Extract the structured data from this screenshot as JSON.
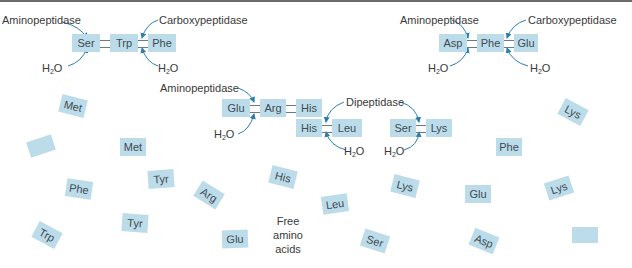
{
  "colors": {
    "residue_fill": "#bcdcea",
    "arrow": "#2a7fae",
    "text": "#3a3a3a"
  },
  "peptides": [
    {
      "id": "p1",
      "residues": [
        "Ser",
        "Trp",
        "Phe"
      ],
      "enzymes": [
        "Aminopeptidase",
        "Carboxypeptidase"
      ],
      "water": [
        "H",
        "2",
        "O"
      ]
    },
    {
      "id": "p2",
      "residues": [
        "Asp",
        "Phe",
        "Glu"
      ],
      "enzymes": [
        "Aminopeptidase",
        "Carboxypeptidase"
      ],
      "water": [
        "H",
        "2",
        "O"
      ]
    },
    {
      "id": "p3",
      "residues": [
        "Glu",
        "Arg",
        "His"
      ],
      "enzymes": [
        "Aminopeptidase"
      ],
      "water": [
        "H",
        "2",
        "O"
      ]
    },
    {
      "id": "dipeptides",
      "enzyme": "Dipeptidase",
      "pairs": [
        [
          "His",
          "Leu"
        ],
        [
          "Ser",
          "Lys"
        ]
      ],
      "water": [
        "H",
        "2",
        "O"
      ]
    }
  ],
  "free_amino_acids": {
    "label_lines": [
      "Free",
      "amino",
      "acids"
    ],
    "items": [
      "Met",
      "",
      "Met",
      "Phe",
      "Tyr",
      "Arg",
      "Tyr",
      "Trp",
      "Glu",
      "His",
      "Leu",
      "Ser",
      "Lys",
      "Glu",
      "Lys",
      "Asp",
      "Lys",
      "Phe",
      ""
    ]
  }
}
